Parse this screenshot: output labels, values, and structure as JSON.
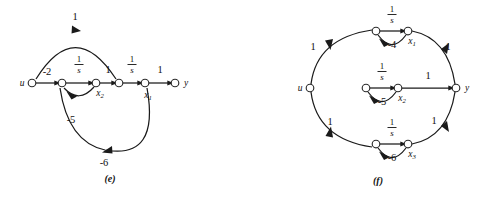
{
  "figure": {
    "background_color": "#ffffff",
    "ink_color": "#111111",
    "panels": [
      {
        "id": "e",
        "caption": "(e)",
        "input_label": "u",
        "output_label": "y",
        "state_labels": [
          "x2",
          "x1"
        ],
        "state_label_display": [
          {
            "base": "x",
            "sub": "2"
          },
          {
            "base": "x",
            "sub": "1"
          }
        ],
        "nodes": [
          {
            "name": "node-u",
            "label": "u",
            "x": 32,
            "y": 83
          },
          {
            "name": "node-e2",
            "label": "",
            "x": 62,
            "y": 83
          },
          {
            "name": "node-x2",
            "label": "x2",
            "x": 96,
            "y": 83
          },
          {
            "name": "node-e4",
            "label": "",
            "x": 119,
            "y": 83
          },
          {
            "name": "node-x1",
            "label": "x1",
            "x": 145,
            "y": 83
          },
          {
            "name": "node-y",
            "label": "y",
            "x": 175,
            "y": 83
          }
        ],
        "edges": [
          {
            "name": "edge-u-to-n2",
            "gain": "-2",
            "kind": "plain",
            "from": "node-u",
            "to": "node-e2"
          },
          {
            "name": "edge-n2-to-x2",
            "gain": "1/s",
            "kind": "fraction",
            "from": "node-e2",
            "to": "node-x2"
          },
          {
            "name": "edge-x2-to-n4",
            "gain": "1",
            "kind": "plain",
            "from": "node-x2",
            "to": "node-e4"
          },
          {
            "name": "edge-n4-to-x1",
            "gain": "1/s",
            "kind": "fraction",
            "from": "node-e4",
            "to": "node-x1"
          },
          {
            "name": "edge-x1-to-y",
            "gain": "1",
            "kind": "plain",
            "from": "node-x1",
            "to": "node-y"
          },
          {
            "name": "edge-u-arc-to-n4",
            "gain": "1",
            "kind": "plain",
            "from": "node-u",
            "to": "node-e4"
          },
          {
            "name": "edge-x2-loop-n2",
            "gain": "-5",
            "kind": "plain",
            "from": "node-x2",
            "to": "node-e2"
          },
          {
            "name": "edge-x1-loop-n2",
            "gain": "-6",
            "kind": "plain",
            "from": "node-x1",
            "to": "node-e2"
          }
        ],
        "gain_labels": [
          {
            "name": "gain-label-top-arc",
            "text": "1",
            "x": 75,
            "y": 20,
            "kind": "plain"
          },
          {
            "name": "gain-label-minus2",
            "text": "-2",
            "x": 47,
            "y": 75,
            "kind": "plain"
          },
          {
            "name": "gain-label-inv-s-1",
            "text": "1/s",
            "x": 79,
            "y": 66,
            "kind": "fraction"
          },
          {
            "name": "gain-label-one-mid",
            "text": "1",
            "x": 108,
            "y": 73,
            "kind": "plain"
          },
          {
            "name": "gain-label-inv-s-2",
            "text": "1/s",
            "x": 132,
            "y": 66,
            "kind": "fraction"
          },
          {
            "name": "gain-label-one-out",
            "text": "1",
            "x": 160,
            "y": 73,
            "kind": "plain"
          },
          {
            "name": "gain-label-minus5",
            "text": "-5",
            "x": 71,
            "y": 123,
            "kind": "plain"
          },
          {
            "name": "gain-label-minus6",
            "text": "-6",
            "x": 104,
            "y": 162,
            "kind": "plain"
          }
        ],
        "caption_position": {
          "x": 110,
          "y": 182
        }
      },
      {
        "id": "f",
        "caption": "(f)",
        "input_label": "u",
        "output_label": "y",
        "state_labels": [
          "x1",
          "x2",
          "x3"
        ],
        "state_label_display": [
          {
            "base": "x",
            "sub": "1"
          },
          {
            "base": "x",
            "sub": "2"
          },
          {
            "base": "x",
            "sub": "3"
          }
        ],
        "nodes": [
          {
            "name": "node-u",
            "label": "u",
            "x": 310,
            "y": 88
          },
          {
            "name": "node-top-in",
            "label": "",
            "x": 376,
            "y": 31
          },
          {
            "name": "node-x1",
            "label": "x1",
            "x": 408,
            "y": 31
          },
          {
            "name": "node-mid-in",
            "label": "",
            "x": 366,
            "y": 88
          },
          {
            "name": "node-x2",
            "label": "x2",
            "x": 398,
            "y": 88
          },
          {
            "name": "node-bot-in",
            "label": "",
            "x": 376,
            "y": 144
          },
          {
            "name": "node-x3",
            "label": "x3",
            "x": 408,
            "y": 144
          },
          {
            "name": "node-y",
            "label": "y",
            "x": 456,
            "y": 88
          }
        ],
        "edges": [
          {
            "name": "edge-u-to-top",
            "gain": "1",
            "kind": "plain",
            "from": "node-u",
            "to": "node-top-in"
          },
          {
            "name": "edge-u-to-mid",
            "gain": "1",
            "kind": "plain",
            "from": "node-u",
            "to": "node-mid-in"
          },
          {
            "name": "edge-u-to-bot",
            "gain": "1",
            "kind": "plain",
            "from": "node-u",
            "to": "node-bot-in"
          },
          {
            "name": "edge-top-inv-s",
            "gain": "1/s",
            "kind": "fraction",
            "from": "node-top-in",
            "to": "node-x1"
          },
          {
            "name": "edge-mid-inv-s",
            "gain": "1/s",
            "kind": "fraction",
            "from": "node-mid-in",
            "to": "node-x2"
          },
          {
            "name": "edge-bot-inv-s",
            "gain": "1/s",
            "kind": "fraction",
            "from": "node-bot-in",
            "to": "node-x3"
          },
          {
            "name": "edge-x1-feedback",
            "gain": "-4",
            "kind": "plain",
            "from": "node-x1",
            "to": "node-top-in"
          },
          {
            "name": "edge-x2-feedback",
            "gain": "-5",
            "kind": "plain",
            "from": "node-x2",
            "to": "node-mid-in"
          },
          {
            "name": "edge-x3-feedback",
            "gain": "-6",
            "kind": "plain",
            "from": "node-x3",
            "to": "node-bot-in"
          },
          {
            "name": "edge-x1-to-y",
            "gain": "1",
            "kind": "plain",
            "from": "node-x1",
            "to": "node-y"
          },
          {
            "name": "edge-x2-to-y",
            "gain": "1",
            "kind": "plain",
            "from": "node-x2",
            "to": "node-y"
          },
          {
            "name": "edge-x3-to-y",
            "gain": "1",
            "kind": "plain",
            "from": "node-x3",
            "to": "node-y"
          }
        ],
        "gain_labels": [
          {
            "name": "gain-label-inv-s-top",
            "text": "1/s",
            "x": 392,
            "y": 14,
            "kind": "fraction"
          },
          {
            "name": "gain-label-minus4",
            "text": "-4",
            "x": 392,
            "y": 48,
            "kind": "plain"
          },
          {
            "name": "gain-label-u-top",
            "text": "1",
            "x": 313,
            "y": 48,
            "kind": "plain"
          },
          {
            "name": "gain-label-y-top",
            "text": "1",
            "x": 448,
            "y": 48,
            "kind": "plain"
          },
          {
            "name": "gain-label-inv-s-mid",
            "text": "1/s",
            "x": 382,
            "y": 71,
            "kind": "fraction"
          },
          {
            "name": "gain-label-minus5",
            "text": "-5",
            "x": 382,
            "y": 105,
            "kind": "plain"
          },
          {
            "name": "gain-label-mid-to-y",
            "text": "1",
            "x": 428,
            "y": 78,
            "kind": "plain"
          },
          {
            "name": "gain-label-inv-s-bot",
            "text": "1/s",
            "x": 392,
            "y": 127,
            "kind": "fraction"
          },
          {
            "name": "gain-label-minus6",
            "text": "-6",
            "x": 392,
            "y": 161,
            "kind": "plain"
          },
          {
            "name": "gain-label-u-bot",
            "text": "1",
            "x": 330,
            "y": 123,
            "kind": "plain"
          },
          {
            "name": "gain-label-y-bot",
            "text": "1",
            "x": 434,
            "y": 122,
            "kind": "plain"
          }
        ],
        "caption_position": {
          "x": 378,
          "y": 184
        }
      }
    ]
  }
}
